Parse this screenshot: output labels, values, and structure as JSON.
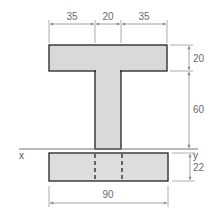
{
  "diagram": {
    "type": "T-section with bottom plate cross-section",
    "colors": {
      "fill": "#d9d9d9",
      "outline": "#222222",
      "dimension_line": "#8a8a8a",
      "text": "#6b6b6b"
    },
    "dimensions": {
      "top_left": "35",
      "top_middle": "20",
      "top_right": "35",
      "right_flange": "20",
      "right_web": "60",
      "right_plate": "22",
      "bottom_width": "90"
    },
    "axes": {
      "x_label": "x",
      "y_label": "y"
    }
  }
}
